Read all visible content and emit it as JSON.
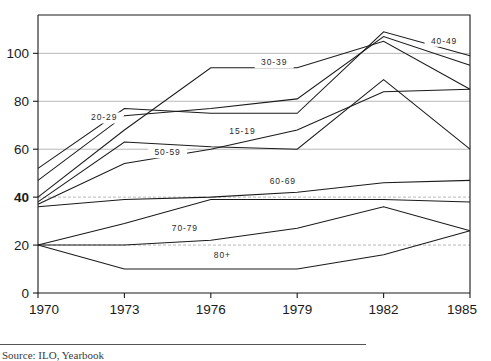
{
  "chart_data": {
    "type": "line",
    "title": "",
    "subtitle": "",
    "xlabel": "",
    "ylabel": "",
    "x": [
      1970,
      1973,
      1976,
      1979,
      1982,
      1985
    ],
    "xtick_labels": [
      "1970",
      "1973",
      "1976",
      "1979",
      "1982",
      "1985"
    ],
    "ytick_labels": [
      "0",
      "20",
      "40",
      "60",
      "80",
      "100"
    ],
    "ytick_values": [
      0,
      20,
      40,
      60,
      80,
      100
    ],
    "xlim": [
      1970,
      1985
    ],
    "ylim": [
      0,
      116
    ],
    "grid": "horizontal-dashed",
    "legend_position": "inline-annotations",
    "series": [
      {
        "name": "15-19",
        "label": "15-19",
        "label_x": 1977.1,
        "label_y": 66.5,
        "values": [
          52,
          77,
          75,
          75,
          109,
          99
        ]
      },
      {
        "name": "20-29",
        "label": "20-29",
        "label_x": 1972.3,
        "label_y": 72.0,
        "values": [
          47,
          74,
          77,
          81,
          107,
          95
        ]
      },
      {
        "name": "30-39",
        "label": "30-39",
        "label_x": 1978.2,
        "label_y": 95.0,
        "values": [
          40,
          68,
          94,
          94,
          105,
          85
        ]
      },
      {
        "name": "40-49",
        "label": "40-49",
        "label_x": 1984.1,
        "label_y": 104.0,
        "values": [
          37,
          54,
          60,
          68,
          84,
          85
        ]
      },
      {
        "name": "50-59",
        "label": "50-59",
        "label_x": 1974.5,
        "label_y": 57.5,
        "values": [
          38,
          63,
          61,
          60,
          89,
          60
        ]
      },
      {
        "name": "60-69",
        "label": "60-69",
        "label_x": 1978.5,
        "label_y": 45.5,
        "values": [
          36,
          39,
          40,
          42,
          46,
          47
        ]
      },
      {
        "name": "70-79",
        "label": "70-79",
        "label_x": 1975.1,
        "label_y": 26.0,
        "values": [
          20,
          29,
          39,
          39,
          39,
          38
        ]
      },
      {
        "name": "80+",
        "label": "80+",
        "label_x": 1976.4,
        "label_y": 14.5,
        "values": [
          20,
          20,
          22,
          27,
          36,
          26
        ]
      },
      {
        "name": "80+-lower",
        "label": "",
        "label_x": 0,
        "label_y": 0,
        "values": [
          20,
          10,
          10,
          10,
          16,
          26
        ]
      }
    ]
  },
  "footer": {
    "caption": "Source: ILO, Yearbook"
  },
  "colors": {
    "ink": "#1a1a1a",
    "grid": "#9a9a9a",
    "background": "#ffffff"
  }
}
